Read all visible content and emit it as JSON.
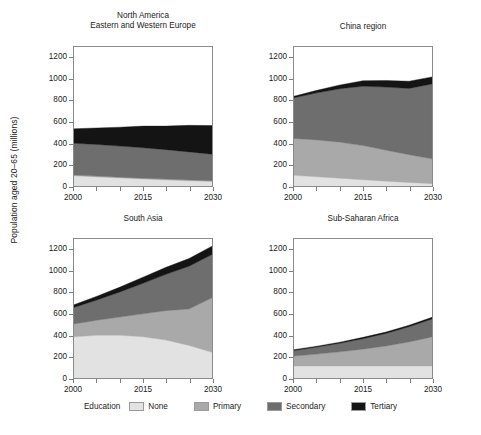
{
  "figure": {
    "ylabel": "Population aged 20–65 (millions)",
    "width": 481,
    "height": 435
  },
  "legend": {
    "title": "Education",
    "entries": [
      {
        "label": "None",
        "color": "#e2e2e2"
      },
      {
        "label": "Primary",
        "color": "#a9a9a9"
      },
      {
        "label": "Secondary",
        "color": "#6e6e6e"
      },
      {
        "label": "Tertiary",
        "color": "#141414"
      }
    ]
  },
  "axes": {
    "ytick_values": [
      0,
      200,
      400,
      600,
      800,
      1000,
      1200
    ],
    "ylim": [
      0,
      1300
    ],
    "xlim": [
      2000,
      2030
    ],
    "xtick_values": [
      2000,
      2005,
      2010,
      2015,
      2020,
      2025,
      2030
    ],
    "xtick_labels_shown": [
      "2000",
      "2015",
      "2030"
    ],
    "grid": false
  },
  "chart_data": [
    {
      "type": "area",
      "stacked": true,
      "panel": "top-left",
      "title": "North America\nEastern and Western Europe",
      "xlabel": "",
      "ylabel": "Population aged 20–65 (millions)",
      "xlim": [
        2000,
        2030
      ],
      "ylim": [
        0,
        1300
      ],
      "x": [
        2000,
        2005,
        2010,
        2015,
        2020,
        2025,
        2030
      ],
      "categories": [
        "None",
        "Primary",
        "Secondary",
        "Tertiary"
      ],
      "series": [
        {
          "name": "None",
          "color": "#e2e2e2",
          "values": [
            95,
            85,
            75,
            65,
            57,
            49,
            42
          ]
        },
        {
          "name": "Primary",
          "color": "#a9a9a9",
          "values": [
            8,
            8,
            8,
            8,
            8,
            8,
            8
          ]
        },
        {
          "name": "Secondary",
          "color": "#6e6e6e",
          "values": [
            297,
            295,
            290,
            285,
            275,
            262,
            248
          ]
        },
        {
          "name": "Tertiary",
          "color": "#141414",
          "values": [
            135,
            155,
            177,
            202,
            220,
            248,
            267
          ]
        }
      ],
      "totals": [
        535,
        543,
        550,
        560,
        560,
        567,
        565
      ]
    },
    {
      "type": "area",
      "stacked": true,
      "panel": "top-right",
      "title": "China region",
      "xlabel": "",
      "ylabel": "",
      "xlim": [
        2000,
        2030
      ],
      "ylim": [
        0,
        1300
      ],
      "x": [
        2000,
        2005,
        2010,
        2015,
        2020,
        2025,
        2030
      ],
      "categories": [
        "None",
        "Primary",
        "Secondary",
        "Tertiary"
      ],
      "series": [
        {
          "name": "None",
          "color": "#e2e2e2",
          "values": [
            100,
            86,
            72,
            58,
            45,
            33,
            22
          ]
        },
        {
          "name": "Primary",
          "color": "#a9a9a9",
          "values": [
            345,
            345,
            338,
            320,
            290,
            260,
            232
          ]
        },
        {
          "name": "Secondary",
          "color": "#6e6e6e",
          "values": [
            380,
            440,
            500,
            555,
            590,
            620,
            700
          ]
        },
        {
          "name": "Tertiary",
          "color": "#141414",
          "values": [
            15,
            24,
            35,
            52,
            62,
            67,
            66
          ]
        }
      ],
      "totals": [
        840,
        895,
        945,
        985,
        987,
        980,
        1020
      ]
    },
    {
      "type": "area",
      "stacked": true,
      "panel": "bottom-left",
      "title": "South Asia",
      "xlabel": "",
      "ylabel": "Population aged 20–65 (millions)",
      "xlim": [
        2000,
        2030
      ],
      "ylim": [
        0,
        1300
      ],
      "x": [
        2000,
        2005,
        2010,
        2015,
        2020,
        2025,
        2030
      ],
      "categories": [
        "None",
        "Primary",
        "Secondary",
        "Tertiary"
      ],
      "series": [
        {
          "name": "None",
          "color": "#e2e2e2",
          "values": [
            385,
            400,
            400,
            385,
            355,
            305,
            240
          ]
        },
        {
          "name": "Primary",
          "color": "#a9a9a9",
          "values": [
            120,
            140,
            170,
            215,
            275,
            340,
            510
          ]
        },
        {
          "name": "Secondary",
          "color": "#6e6e6e",
          "values": [
            155,
            190,
            235,
            285,
            340,
            400,
            405
          ]
        },
        {
          "name": "Tertiary",
          "color": "#141414",
          "values": [
            25,
            35,
            45,
            58,
            65,
            72,
            78
          ]
        }
      ],
      "totals": [
        685,
        765,
        850,
        943,
        1035,
        1117,
        1233
      ]
    },
    {
      "type": "area",
      "stacked": true,
      "panel": "bottom-right",
      "title": "Sub-Saharan Africa",
      "xlabel": "",
      "ylabel": "",
      "xlim": [
        2000,
        2030
      ],
      "ylim": [
        0,
        1300
      ],
      "x": [
        2000,
        2005,
        2010,
        2015,
        2020,
        2025,
        2030
      ],
      "categories": [
        "None",
        "Primary",
        "Secondary",
        "Tertiary"
      ],
      "series": [
        {
          "name": "None",
          "color": "#e2e2e2",
          "values": [
            112,
            112,
            112,
            112,
            112,
            112,
            112
          ]
        },
        {
          "name": "Primary",
          "color": "#a9a9a9",
          "values": [
            93,
            112,
            133,
            158,
            187,
            225,
            272
          ]
        },
        {
          "name": "Secondary",
          "color": "#6e6e6e",
          "values": [
            52,
            65,
            80,
            98,
            118,
            142,
            168
          ]
        },
        {
          "name": "Tertiary",
          "color": "#141414",
          "values": [
            8,
            9,
            10,
            12,
            13,
            14,
            15
          ]
        }
      ],
      "totals": [
        265,
        298,
        335,
        380,
        430,
        493,
        567
      ]
    }
  ]
}
